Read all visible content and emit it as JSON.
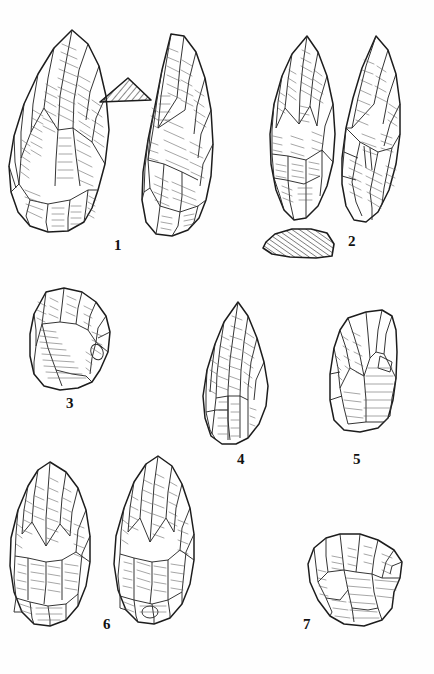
{
  "plate": {
    "title": "Lithic artefact plate",
    "description": "Archaeological pen-and-ink plate of seven knapped stone tools with two hatched cross-section profiles",
    "background_color": "#fefefe",
    "ink_color": "#1a1a1a",
    "shading_color": "#555555",
    "width": 434,
    "height": 674
  },
  "figures": [
    {
      "number": "1",
      "label": "1",
      "name": "bifacial-handaxe-pair",
      "views": [
        "dorsal face",
        "ventral face"
      ],
      "has_section": true,
      "section_shape": "triangle"
    },
    {
      "number": "2",
      "label": "2",
      "name": "lanceolate-biface-pair",
      "views": [
        "dorsal face",
        "ventral face"
      ],
      "has_section": true,
      "section_shape": "irregular-plano-convex"
    },
    {
      "number": "3",
      "label": "3",
      "name": "side-scraper-flake",
      "views": [
        "dorsal face"
      ],
      "has_section": false,
      "section_shape": ""
    },
    {
      "number": "4",
      "label": "4",
      "name": "convergent-point",
      "views": [
        "dorsal face"
      ],
      "has_section": false,
      "section_shape": ""
    },
    {
      "number": "5",
      "label": "5",
      "name": "transverse-scraper",
      "views": [
        "dorsal face"
      ],
      "has_section": false,
      "section_shape": ""
    },
    {
      "number": "6",
      "label": "6",
      "name": "cordiform-biface-pair",
      "views": [
        "dorsal face",
        "ventral face"
      ],
      "has_section": false,
      "section_shape": ""
    },
    {
      "number": "7",
      "label": "7",
      "name": "discoidal-core",
      "views": [
        "dorsal face"
      ],
      "has_section": false,
      "section_shape": ""
    }
  ]
}
